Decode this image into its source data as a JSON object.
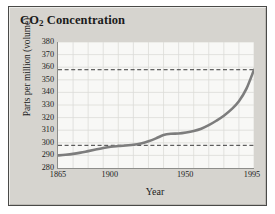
{
  "figure": {
    "title_main": "CO",
    "title_sub": "2",
    "title_rest": " Concentration",
    "title_full": "CO2 Concentration"
  },
  "colors": {
    "frame_background": "#d6d4cf",
    "frame_border": "#4a4a48",
    "plot_background": "#f8f8f6",
    "gridline": "#dcdcd8",
    "axis": "#8d8d8a",
    "curve": "#7d7d7d",
    "dashed_reference": "#3a3a3a",
    "text": "#1b1b1b"
  },
  "chart_data": {
    "type": "line",
    "title": "CO2 Concentration",
    "xlabel": "Year",
    "ylabel": "Parts per million (volume)",
    "xlim": [
      1865,
      1995
    ],
    "ylim": [
      280,
      380
    ],
    "grid": true,
    "legend": "none",
    "yticks": [
      280,
      290,
      300,
      310,
      320,
      330,
      340,
      350,
      360,
      370,
      380
    ],
    "ytick_labels": [
      "280",
      "290",
      "300",
      "310",
      "320",
      "330",
      "340",
      "350",
      "360",
      "370",
      "380"
    ],
    "xticks": [
      1865,
      1900,
      1950,
      1995
    ],
    "xtick_labels": [
      "1865",
      "1900",
      "1950",
      "1995"
    ],
    "x_gridlines": [
      1875,
      1885,
      1895,
      1905,
      1915,
      1925,
      1935,
      1945,
      1955,
      1965,
      1975,
      1985,
      1995
    ],
    "annotations": [
      {
        "type": "hline",
        "value": 358,
        "style": "dashed",
        "label": "upper reference 358 ppm"
      },
      {
        "type": "hline",
        "value": 298,
        "style": "dashed",
        "label": "lower reference 298 ppm"
      }
    ],
    "series": [
      {
        "name": "CO2 concentration",
        "x": [
          1865,
          1870,
          1875,
          1880,
          1885,
          1890,
          1895,
          1900,
          1905,
          1910,
          1915,
          1920,
          1925,
          1930,
          1935,
          1940,
          1945,
          1950,
          1955,
          1960,
          1965,
          1970,
          1975,
          1980,
          1985,
          1990,
          1995
        ],
        "values": [
          290,
          290.5,
          291.2,
          292.2,
          293.4,
          294.6,
          295.8,
          296.8,
          297.4,
          297.9,
          298.4,
          299.5,
          301.2,
          303.5,
          306.2,
          307.2,
          307.4,
          308.2,
          309.4,
          311.2,
          314.0,
          317.5,
          321.5,
          326.5,
          333.0,
          343.0,
          358.0
        ]
      }
    ]
  }
}
